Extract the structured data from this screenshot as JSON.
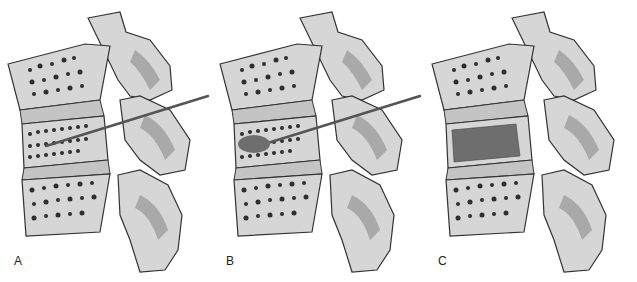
{
  "figure": {
    "panels": [
      {
        "label": "A",
        "offset_x": 0,
        "needle": true,
        "cement": false
      },
      {
        "label": "B",
        "offset_x": 212,
        "needle": true,
        "cement": "partial"
      },
      {
        "label": "C",
        "offset_x": 424,
        "needle": false,
        "cement": "full"
      }
    ],
    "colors": {
      "bone": "#d6d6d6",
      "bone_shade": "#a9a9a9",
      "outline": "#333333",
      "pores": "#2e2e2e",
      "cement": "#6e6e6e",
      "needle": "#555555",
      "disc": "#c4c4c4"
    }
  }
}
